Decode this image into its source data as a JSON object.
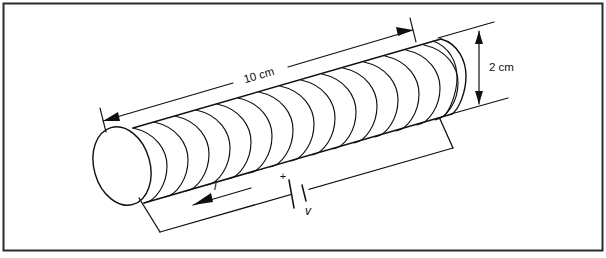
{
  "figure": {
    "kind": "solenoid-circuit-diagram",
    "background_color": "#ffffff",
    "line_color": "#101010",
    "border_color": "#2b2b2b"
  },
  "dimensions": {
    "length_label": "10 cm",
    "diameter_label": "2 cm"
  },
  "circuit": {
    "current_label": "i",
    "voltage_label": "v",
    "polarity_label": "+"
  },
  "geometry": {
    "turns": 15,
    "axis_angle_deg": -16
  }
}
